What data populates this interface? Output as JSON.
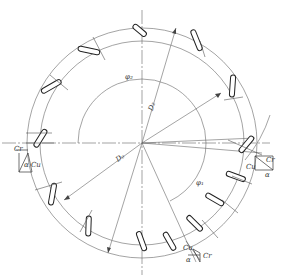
{
  "diagram": {
    "type": "technical-drawing",
    "center": [
      142,
      143
    ],
    "circles": {
      "outer_radius_px": 115,
      "ring_inner_radius_px": 102,
      "inner_radius_px": 64
    },
    "labels": {
      "outer_diameter": "D₂",
      "inner_diameter": "D₁",
      "center_diameter": "D₀",
      "angle_top": "φ₂",
      "angle_bottom": "φ₁",
      "left_triangle": {
        "c_r": "Cr",
        "c_u": "Cu",
        "alpha": "α"
      },
      "right_triangle": {
        "c_r": "Cr",
        "c_u": "Cu",
        "alpha": "α"
      },
      "bottom_triangle": {
        "c_r": "Cr",
        "c_u": "Cu",
        "alpha": "α"
      }
    },
    "colors": {
      "line": "#555555",
      "stroke_dark": "#222222",
      "background": "#ffffff"
    }
  }
}
